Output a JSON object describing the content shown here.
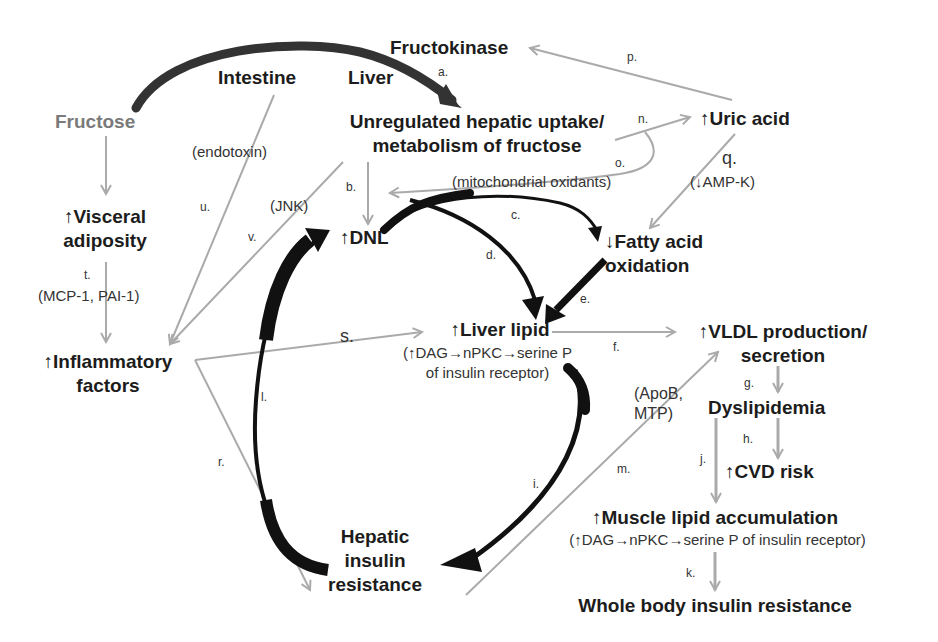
{
  "diagram": {
    "type": "pathway-flowchart",
    "colors": {
      "primary_arrow": "#000000",
      "secondary_arrow": "#aaaaaa",
      "fructose_text": "#7a7a7a",
      "text": "#1c1c1c",
      "background": "#ffffff"
    },
    "nodes": {
      "fructose": "Fructose",
      "intestine": "Intestine",
      "liver": "Liver",
      "fructokinase": "Fructokinase",
      "hepatic_uptake": {
        "line1": "Unregulated hepatic uptake/",
        "line2": "metabolism of fructose"
      },
      "uric_acid": "↑Uric acid",
      "visceral_adiposity": {
        "line1": "↑Visceral",
        "line2": "adiposity"
      },
      "dnl": "↑DNL",
      "fatty_acid_oxidation": {
        "line1": "↓Fatty acid",
        "line2": "oxidation"
      },
      "inflammatory_factors": {
        "line1": "↑Inflammatory",
        "line2": "factors"
      },
      "liver_lipid": {
        "title": "↑Liver lipid",
        "detail1": "(↑DAG→nPKC→serine P",
        "detail2": "of insulin receptor)"
      },
      "vldl": {
        "line1": "↑VLDL production/",
        "line2": "secretion"
      },
      "dyslipidemia": "Dyslipidemia",
      "cvd_risk": "↑CVD risk",
      "hepatic_insulin_resistance": {
        "line1": "Hepatic",
        "line2": "insulin",
        "line3": "resistance"
      },
      "muscle_lipid": {
        "title": "↑Muscle lipid accumulation",
        "detail": "(↑DAG→nPKC→serine P of insulin receptor)"
      },
      "whole_body_ir": "Whole body insulin resistance"
    },
    "annotations": {
      "endotoxin": "(endotoxin)",
      "jnk": "(JNK)",
      "mitochondrial_oxidants": "(mitochondrial oxidants)",
      "ampk": "(↓AMP-K)",
      "mcp_pai": "(MCP-1, PAI-1)",
      "apob_mtp_1": "(ApoB,",
      "apob_mtp_2": "MTP)"
    },
    "edge_labels": {
      "a": "a.",
      "b": "b.",
      "c": "c.",
      "d": "d.",
      "e": "e.",
      "f": "f.",
      "g": "g.",
      "h": "h.",
      "i": "i.",
      "j": "j.",
      "k": "k.",
      "l": "l.",
      "m": "m.",
      "n": "n.",
      "o": "o.",
      "p": "p.",
      "q": "q.",
      "r": "r.",
      "s": "s.",
      "t": "t.",
      "u": "u.",
      "v": "v."
    },
    "edges": [
      {
        "id": "a",
        "from": "Fructose",
        "to": "Unregulated hepatic uptake/metabolism of fructose",
        "style": "thick-black"
      },
      {
        "id": "b",
        "from": "Unregulated hepatic uptake/metabolism of fructose",
        "to": "DNL",
        "style": "grey"
      },
      {
        "id": "c",
        "from": "DNL",
        "to": "Fatty acid oxidation",
        "style": "thick-black"
      },
      {
        "id": "d",
        "from": "DNL",
        "to": "Liver lipid",
        "style": "thick-black"
      },
      {
        "id": "e",
        "from": "Fatty acid oxidation",
        "to": "Liver lipid",
        "style": "thick-black"
      },
      {
        "id": "f",
        "from": "Liver lipid",
        "to": "VLDL production/secretion",
        "style": "grey"
      },
      {
        "id": "g",
        "from": "VLDL production/secretion",
        "to": "Dyslipidemia",
        "style": "grey"
      },
      {
        "id": "h",
        "from": "Dyslipidemia",
        "to": "CVD risk",
        "style": "grey"
      },
      {
        "id": "i",
        "from": "Liver lipid",
        "to": "Hepatic insulin resistance",
        "style": "thick-black"
      },
      {
        "id": "j",
        "from": "Dyslipidemia",
        "to": "Muscle lipid accumulation",
        "style": "grey"
      },
      {
        "id": "k",
        "from": "Muscle lipid accumulation",
        "to": "Whole body insulin resistance",
        "style": "grey"
      },
      {
        "id": "l",
        "from": "Hepatic insulin resistance",
        "to": "DNL",
        "style": "thick-black"
      },
      {
        "id": "m",
        "from": "Hepatic insulin resistance",
        "to": "VLDL production/secretion",
        "style": "grey"
      },
      {
        "id": "n",
        "from": "Unregulated hepatic uptake/metabolism of fructose",
        "to": "Uric acid",
        "style": "grey"
      },
      {
        "id": "o",
        "from": "Uric acid",
        "to": "DNL",
        "style": "grey",
        "via": "mitochondrial oxidants"
      },
      {
        "id": "p",
        "from": "Uric acid",
        "to": "Fructokinase",
        "style": "grey"
      },
      {
        "id": "q",
        "from": "Uric acid",
        "to": "Fatty acid oxidation",
        "style": "grey",
        "via": "↓AMP-K"
      },
      {
        "id": "r",
        "from": "Inflammatory factors",
        "to": "Hepatic insulin resistance",
        "style": "grey"
      },
      {
        "id": "s",
        "from": "Inflammatory factors",
        "to": "Liver lipid",
        "style": "grey"
      },
      {
        "id": "t",
        "from": "Visceral adiposity",
        "to": "Inflammatory factors",
        "style": "grey",
        "via": "MCP-1, PAI-1"
      },
      {
        "id": "u",
        "from": "Intestine",
        "to": "Inflammatory factors",
        "style": "grey",
        "via": "endotoxin"
      },
      {
        "id": "v",
        "from": "Unregulated hepatic uptake/metabolism of fructose",
        "to": "Inflammatory factors",
        "style": "grey",
        "via": "JNK"
      },
      {
        "id": "fructose-visceral",
        "from": "Fructose",
        "to": "Visceral adiposity",
        "style": "grey"
      }
    ]
  }
}
